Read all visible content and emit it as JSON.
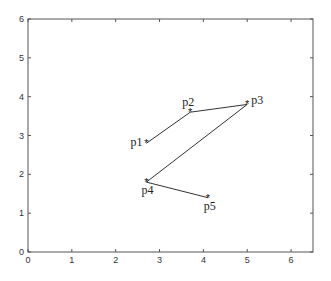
{
  "chart_data": {
    "type": "line",
    "title": "",
    "xlabel": "",
    "ylabel": "",
    "xlim": [
      0,
      6.5
    ],
    "ylim": [
      0,
      6
    ],
    "grid": false,
    "x_ticks": [
      "0",
      "1",
      "2",
      "3",
      "4",
      "5",
      "6"
    ],
    "y_ticks": [
      "0",
      "1",
      "2",
      "3",
      "4",
      "5",
      "6"
    ],
    "series": [
      {
        "name": "path",
        "points": [
          {
            "label": "p1",
            "x": 2.7,
            "y": 2.8
          },
          {
            "label": "p2",
            "x": 3.7,
            "y": 3.6
          },
          {
            "label": "p3",
            "x": 5.0,
            "y": 3.8
          },
          {
            "label": "p4",
            "x": 2.7,
            "y": 1.8
          },
          {
            "label": "p5",
            "x": 4.1,
            "y": 1.4
          }
        ]
      }
    ],
    "line_color": "#333333",
    "marker": "*"
  }
}
